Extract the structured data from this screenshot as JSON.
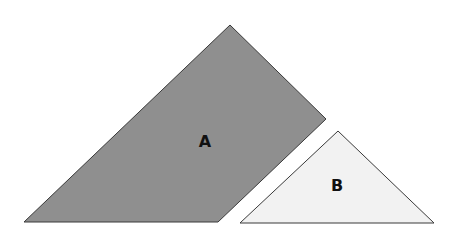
{
  "diagram": {
    "shapes": [
      {
        "id": "A",
        "label": "A",
        "type": "quadrilateral",
        "fill": "#8f8f8f",
        "stroke": "#3a3a3a"
      },
      {
        "id": "B",
        "label": "B",
        "type": "triangle",
        "fill": "#f2f2f2",
        "stroke": "#3a3a3a"
      }
    ]
  }
}
